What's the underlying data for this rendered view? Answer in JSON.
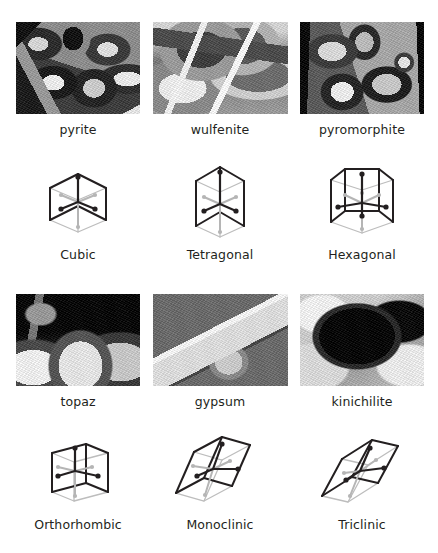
{
  "figure": {
    "layout": "2 blocks of 3 columns; each block = mineral photo row over unit-cell diagram row",
    "background_color": "#ffffff",
    "caption_color": "#231f20",
    "cell_edge_color": "#231f20",
    "cell_hidden_edge_color": "#bdbdbd",
    "axis_front_color": "#231f20",
    "axis_back_color": "#b5b5b5"
  },
  "blocks": [
    {
      "name": "block-upper",
      "columns": [
        {
          "mineral": {
            "label": "pyrite",
            "photo_name": "pyrite-photo",
            "description": "dense cluster of metallic cubic crystals, greyscale"
          },
          "cell": {
            "label": "Cubic",
            "figure_name": "cubic-unit-cell",
            "shape": "cube",
            "axes": 3,
            "axis_dots": 6
          }
        },
        {
          "mineral": {
            "label": "wulfenite",
            "photo_name": "wulfenite-photo",
            "description": "stack of thin tabular square plates, greyscale"
          },
          "cell": {
            "label": "Tetragonal",
            "figure_name": "tetragonal-unit-cell",
            "shape": "square prism",
            "axes": 3,
            "axis_dots": 6
          }
        },
        {
          "mineral": {
            "label": "pyromorphite",
            "photo_name": "pyromorphite-photo",
            "description": "druse of stubby hexagonal barrel crystals, greyscale"
          },
          "cell": {
            "label": "Hexagonal",
            "figure_name": "hexagonal-unit-cell",
            "shape": "hexagonal prism",
            "axes": 4,
            "axis_dots": 8
          }
        }
      ]
    },
    {
      "name": "block-lower",
      "columns": [
        {
          "mineral": {
            "label": "topaz",
            "photo_name": "topaz-photo",
            "description": "pale prismatic crystals on dark matrix, greyscale"
          },
          "cell": {
            "label": "Orthorhombic",
            "figure_name": "orthorhombic-unit-cell",
            "shape": "rectangular box",
            "axes": 3,
            "axis_dots": 6
          }
        },
        {
          "mineral": {
            "label": "gypsum",
            "photo_name": "gypsum-photo",
            "description": "single elongated translucent blade crystal, greyscale"
          },
          "cell": {
            "label": "Monoclinic",
            "figure_name": "monoclinic-unit-cell",
            "shape": "oblique prism (one inclined angle)",
            "axes": 3,
            "axis_dots": 6
          }
        },
        {
          "mineral": {
            "label": "kinichilite",
            "photo_name": "kinichilite-photo",
            "description": "black blocky aggregate on pale matrix, greyscale"
          },
          "cell": {
            "label": "Triclinic",
            "figure_name": "triclinic-unit-cell",
            "shape": "fully oblique parallelepiped",
            "axes": 3,
            "axis_dots": 6
          }
        }
      ]
    }
  ]
}
